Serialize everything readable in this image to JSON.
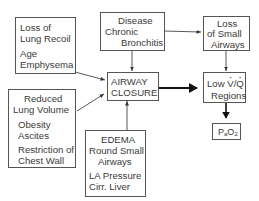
{
  "diagram": {
    "nodes": {
      "loss_lung_recoil": {
        "title_line1": "Loss of",
        "title_line2": "Lung Recoil",
        "cause1": "Age",
        "cause2": "Emphysema"
      },
      "disease": {
        "line1": "Disease",
        "line2": "Chronic",
        "line3": "Bronchitis"
      },
      "loss_small_airways": {
        "line1": "Loss",
        "line2": "of Small",
        "line3": "Airways"
      },
      "airway_closure": {
        "line1": "AIRWAY",
        "line2": "CLOSURE"
      },
      "low_vq": {
        "line1_prefix": "Low ",
        "v": "V",
        "slash": "/",
        "q": "Q",
        "line2": "Regions"
      },
      "reduced_lung_volume": {
        "title_line1": "Reduced",
        "title_line2": "Lung Volume",
        "cause1": "Obesity",
        "cause2": "Ascites",
        "cause3": "Restriction of",
        "cause4": "Chest Wall"
      },
      "edema": {
        "line1": "EDEMA",
        "line2": "Round Small",
        "line3": "Airways",
        "line4": "LA Pressure",
        "line5": "Cirr. Liver"
      },
      "pao2": {
        "p": "P",
        "sub_a": "a",
        "o": "O",
        "sub_2": "2"
      }
    },
    "edges": [
      {
        "from": "loss_lung_recoil",
        "to": "airway_closure"
      },
      {
        "from": "reduced_lung_volume",
        "to": "airway_closure"
      },
      {
        "from": "disease",
        "to": "airway_closure"
      },
      {
        "from": "edema",
        "to": "airway_closure"
      },
      {
        "from": "disease",
        "to": "loss_small_airways"
      },
      {
        "from": "loss_small_airways",
        "to": "low_vq"
      },
      {
        "from": "airway_closure",
        "to": "low_vq",
        "style": "thick"
      },
      {
        "from": "low_vq",
        "to": "pao2",
        "style": "thick"
      }
    ]
  }
}
